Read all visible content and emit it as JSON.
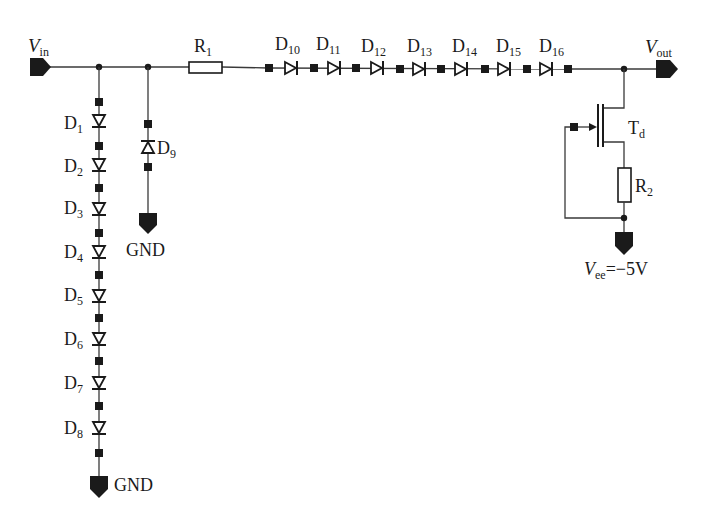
{
  "diagram": {
    "type": "circuit-schematic",
    "ports": {
      "vin": {
        "label": "V",
        "sub": "in"
      },
      "vout": {
        "label": "V",
        "sub": "out"
      },
      "vee": {
        "label": "V",
        "sub": "ee",
        "value": "=−5V"
      },
      "gnd_left": {
        "label": "GND"
      },
      "gnd_mid": {
        "label": "GND"
      }
    },
    "resistors": [
      {
        "id": "R1",
        "label": "R",
        "sub": "1"
      },
      {
        "id": "R2",
        "label": "R",
        "sub": "2"
      }
    ],
    "transistor": {
      "id": "Td",
      "label": "T",
      "sub": "d"
    },
    "shunt_diodes": [
      {
        "id": "D1",
        "label": "D",
        "sub": "1"
      },
      {
        "id": "D2",
        "label": "D",
        "sub": "2"
      },
      {
        "id": "D3",
        "label": "D",
        "sub": "3"
      },
      {
        "id": "D4",
        "label": "D",
        "sub": "4"
      },
      {
        "id": "D5",
        "label": "D",
        "sub": "5"
      },
      {
        "id": "D6",
        "label": "D",
        "sub": "6"
      },
      {
        "id": "D7",
        "label": "D",
        "sub": "7"
      },
      {
        "id": "D8",
        "label": "D",
        "sub": "8"
      }
    ],
    "clamp_diode": {
      "id": "D9",
      "label": "D",
      "sub": "9"
    },
    "series_diodes": [
      {
        "id": "D10",
        "label": "D",
        "sub": "10"
      },
      {
        "id": "D11",
        "label": "D",
        "sub": "11"
      },
      {
        "id": "D12",
        "label": "D",
        "sub": "12"
      },
      {
        "id": "D13",
        "label": "D",
        "sub": "13"
      },
      {
        "id": "D14",
        "label": "D",
        "sub": "14"
      },
      {
        "id": "D15",
        "label": "D",
        "sub": "15"
      },
      {
        "id": "D16",
        "label": "D",
        "sub": "16"
      }
    ]
  }
}
